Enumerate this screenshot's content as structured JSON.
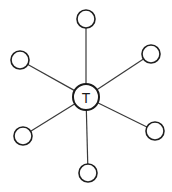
{
  "diagram": {
    "type": "star",
    "width": 172,
    "height": 192,
    "hub": {
      "label": "T",
      "cx": 86,
      "cy": 97,
      "r": 13
    },
    "leaves": [
      {
        "id": "top",
        "label": "",
        "cx": 86,
        "cy": 19,
        "r": 9
      },
      {
        "id": "upper-right",
        "label": "",
        "cx": 151,
        "cy": 54,
        "r": 9
      },
      {
        "id": "lower-right",
        "label": "",
        "cx": 155,
        "cy": 131,
        "r": 9
      },
      {
        "id": "bottom",
        "label": "",
        "cx": 88,
        "cy": 173,
        "r": 9
      },
      {
        "id": "lower-left",
        "label": "",
        "cx": 23,
        "cy": 136,
        "r": 9
      },
      {
        "id": "upper-left",
        "label": "",
        "cx": 20,
        "cy": 60,
        "r": 9
      }
    ],
    "edges": [
      {
        "from": "hub",
        "to": "top"
      },
      {
        "from": "hub",
        "to": "upper-right"
      },
      {
        "from": "hub",
        "to": "lower-right"
      },
      {
        "from": "hub",
        "to": "bottom"
      },
      {
        "from": "hub",
        "to": "lower-left"
      },
      {
        "from": "hub",
        "to": "upper-left"
      }
    ],
    "colors": {
      "background": "#ffffff",
      "edge": "#3a3a3a",
      "node_stroke": "#1e1e1e",
      "node_fill": "#ffffff"
    }
  }
}
